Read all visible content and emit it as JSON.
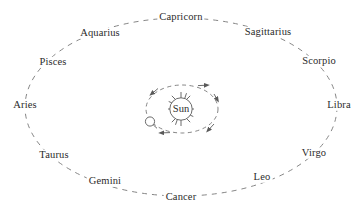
{
  "diagram": {
    "background_color": "#ffffff",
    "line_color": "#6e6e6e",
    "text_color": "#2b2b2b",
    "center_body": {
      "label": "Sun",
      "icon": "sun-icon",
      "cx": 181,
      "cy": 109,
      "r": 13,
      "ray_count": 12
    },
    "orbiting_body": {
      "icon": "earth-circle-icon",
      "label": "",
      "cx": 150,
      "cy": 122,
      "r": 5
    },
    "inner_orbit": {
      "cx": 182,
      "cy": 109,
      "rx": 36,
      "ry": 24,
      "style": "dashed",
      "direction_arrows": 4
    },
    "outer_ellipse": {
      "cx": 181,
      "cy": 107,
      "rx": 156,
      "ry": 89,
      "style": "dashed"
    },
    "signs": [
      {
        "label": "Capricorn",
        "x": 181,
        "y": 17,
        "name": "zodiac-label-capricorn"
      },
      {
        "label": "Sagittarius",
        "x": 268,
        "y": 32,
        "name": "zodiac-label-sagittarius"
      },
      {
        "label": "Scorpio",
        "x": 319,
        "y": 61,
        "name": "zodiac-label-scorpio"
      },
      {
        "label": "Libra",
        "x": 339,
        "y": 105,
        "name": "zodiac-label-libra"
      },
      {
        "label": "Virgo",
        "x": 314,
        "y": 153,
        "name": "zodiac-label-virgo"
      },
      {
        "label": "Leo",
        "x": 262,
        "y": 177,
        "name": "zodiac-label-leo"
      },
      {
        "label": "Cancer",
        "x": 181,
        "y": 197,
        "name": "zodiac-label-cancer"
      },
      {
        "label": "Gemini",
        "x": 105,
        "y": 181,
        "name": "zodiac-label-gemini"
      },
      {
        "label": "Taurus",
        "x": 54,
        "y": 155,
        "name": "zodiac-label-taurus"
      },
      {
        "label": "Aries",
        "x": 25,
        "y": 105,
        "name": "zodiac-label-aries"
      },
      {
        "label": "Pisces",
        "x": 53,
        "y": 62,
        "name": "zodiac-label-pisces"
      },
      {
        "label": "Aquarius",
        "x": 100,
        "y": 33,
        "name": "zodiac-label-aquarius"
      }
    ]
  }
}
